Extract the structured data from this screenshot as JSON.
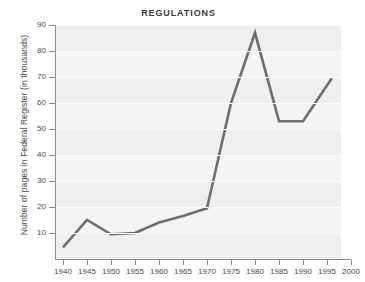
{
  "chart_data": {
    "type": "line",
    "title": "REGULATIONS",
    "xlabel": "",
    "ylabel": "Number of pages in Federal Register (in thousands)",
    "x": [
      1940,
      1945,
      1950,
      1955,
      1960,
      1965,
      1970,
      1975,
      1980,
      1985,
      1990,
      1996
    ],
    "values": [
      4.5,
      15,
      9.5,
      10,
      14,
      16.5,
      19.5,
      60,
      87,
      53,
      53,
      69.5
    ],
    "series": [
      {
        "name": "Pages in Federal Register",
        "values": [
          4.5,
          15,
          9.5,
          10,
          14,
          16.5,
          19.5,
          60,
          87,
          53,
          53,
          69.5
        ]
      }
    ],
    "xtick_labels": [
      "1940",
      "1945",
      "1950",
      "1955",
      "1960",
      "1965",
      "1970",
      "1975",
      "1980",
      "1985",
      "1990",
      "1995",
      "2000"
    ],
    "xtick_values": [
      1940,
      1945,
      1950,
      1955,
      1960,
      1965,
      1970,
      1975,
      1980,
      1985,
      1990,
      1995,
      2000
    ],
    "ytick_labels": [
      "90",
      "80",
      "70",
      "60",
      "50",
      "40",
      "30",
      "20",
      "10"
    ],
    "ytick_values": [
      90,
      80,
      70,
      60,
      50,
      40,
      30,
      20,
      10
    ],
    "xlim": [
      1940,
      2000
    ],
    "ylim": [
      0,
      90
    ],
    "grid": true,
    "legend": "none",
    "line_color": "#6e6e6e",
    "plot_background": "#f4f4f4",
    "axis_color": "#8d8d8d",
    "text_color": "#4a4a4a"
  }
}
